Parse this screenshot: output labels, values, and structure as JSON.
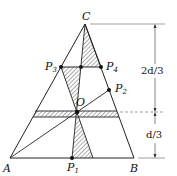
{
  "diagram": {
    "type": "geometry",
    "points": {
      "A": {
        "label": "A",
        "x": 10,
        "y": 158
      },
      "B": {
        "label": "B",
        "x": 134,
        "y": 158
      },
      "C": {
        "label": "C",
        "x": 85,
        "y": 24
      },
      "O": {
        "label": "O",
        "x": 77,
        "y": 112
      },
      "P1": {
        "label": "P",
        "sub": "1",
        "x": 72,
        "y": 158
      },
      "P2": {
        "label": "P",
        "sub": "2",
        "x": 109,
        "y": 90
      },
      "P3": {
        "label": "P",
        "sub": "3",
        "x": 61,
        "y": 67
      },
      "P4": {
        "label": "P",
        "sub": "4",
        "x": 101,
        "y": 67
      }
    },
    "dimensions": {
      "upper": "2d/3",
      "lower": "d/3"
    },
    "colors": {
      "line": "#222222",
      "hatch": "#444444",
      "dim": "#555555"
    }
  }
}
